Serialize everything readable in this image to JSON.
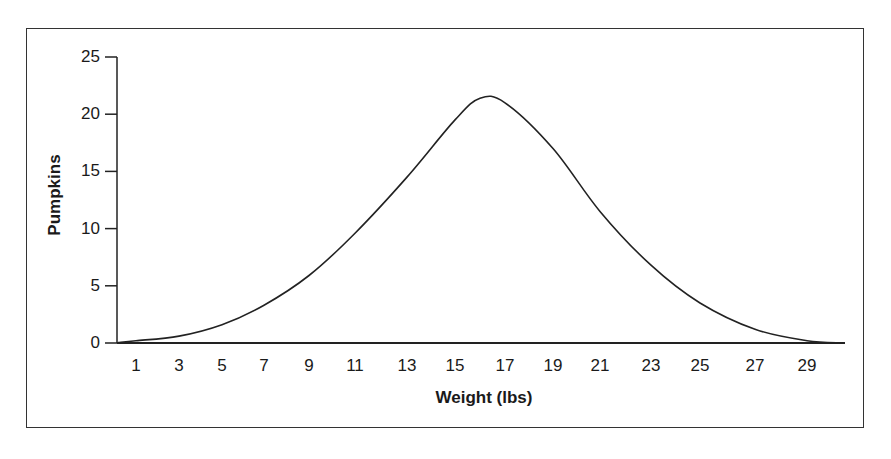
{
  "chart_data": {
    "type": "line",
    "title": "",
    "xlabel": "Weight (lbs)",
    "ylabel": "Pumpkins",
    "ylim": [
      0,
      25
    ],
    "yticks": [
      "0",
      "5",
      "10",
      "15",
      "20",
      "25"
    ],
    "xtick_labels": [
      "1",
      "3",
      "5",
      "7",
      "9",
      "11",
      "13",
      "15",
      "17",
      "19",
      "21",
      "23",
      "25",
      "27",
      "29"
    ],
    "grid": false,
    "legend": null,
    "series": [
      {
        "name": "Pumpkins",
        "x": [
          1,
          3,
          5,
          7,
          9,
          11,
          13,
          15,
          16,
          17,
          19,
          21,
          23,
          25,
          27,
          29,
          30
        ],
        "values": [
          0.2,
          0.6,
          1.6,
          3.3,
          5.9,
          9.6,
          14.5,
          19.5,
          21.4,
          21.0,
          17.0,
          11.5,
          6.8,
          3.5,
          1.2,
          0.2,
          0.0
        ]
      }
    ]
  }
}
